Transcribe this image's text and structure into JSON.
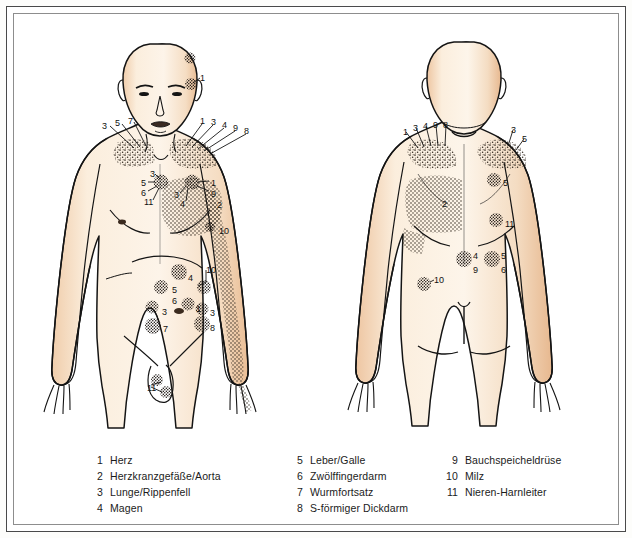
{
  "plate": {
    "title": "Head-Zonen / Referred pain zones chart",
    "views": [
      {
        "name": "front",
        "label": "front view"
      },
      {
        "name": "back",
        "label": "back view"
      }
    ]
  },
  "colors": {
    "skin_light": "#fbeedd",
    "skin_mid": "#f3d9bd",
    "skin_shadow": "#e6b48c",
    "ink": "#1b1b1b",
    "stipple": "#2a2118",
    "page": "#ffffff",
    "frame_outer": "#4a4a4a",
    "frame_inner": "#8d8d8d"
  },
  "legend": {
    "columns": [
      {
        "name": "legend-column-1",
        "entries": [
          {
            "num": "1",
            "text": "Herz"
          },
          {
            "num": "2",
            "text": "Herzkranzgefäße/Aorta"
          },
          {
            "num": "3",
            "text": "Lunge/Rippenfell"
          },
          {
            "num": "4",
            "text": "Magen"
          }
        ]
      },
      {
        "name": "legend-column-2",
        "entries": [
          {
            "num": "5",
            "text": "Leber/Galle"
          },
          {
            "num": "6",
            "text": "Zwölffingerdarm"
          },
          {
            "num": "7",
            "text": "Wurmfortsatz"
          },
          {
            "num": "8",
            "text": "S-förmiger Dickdarm"
          }
        ]
      },
      {
        "name": "legend-column-3",
        "entries": [
          {
            "num": "9",
            "text": "Bauchspeicheldrüse"
          },
          {
            "num": "10",
            "text": "Milz"
          },
          {
            "num": "11",
            "text": "Nieren-Harnleiter"
          }
        ]
      }
    ]
  },
  "front_labels": [
    {
      "id": "front-head-1",
      "num": "1",
      "x": 186,
      "y": 60
    },
    {
      "id": "front-lshoulder-3",
      "num": "3",
      "x": 88,
      "y": 108
    },
    {
      "id": "front-lshoulder-5",
      "num": "5",
      "x": 101,
      "y": 105
    },
    {
      "id": "front-lshoulder-7",
      "num": "7",
      "x": 114,
      "y": 103
    },
    {
      "id": "front-rshoulder-1",
      "num": "1",
      "x": 186,
      "y": 103
    },
    {
      "id": "front-rshoulder-3",
      "num": "3",
      "x": 197,
      "y": 104
    },
    {
      "id": "front-rshoulder-4",
      "num": "4",
      "x": 208,
      "y": 107
    },
    {
      "id": "front-rshoulder-9",
      "num": "9",
      "x": 219,
      "y": 110
    },
    {
      "id": "front-rshoulder-8",
      "num": "8",
      "x": 230,
      "y": 113
    },
    {
      "id": "front-lclav-3",
      "num": "3",
      "x": 136,
      "y": 156
    },
    {
      "id": "front-lclav-5",
      "num": "5",
      "x": 127,
      "y": 165
    },
    {
      "id": "front-lclav-6",
      "num": "6",
      "x": 127,
      "y": 175
    },
    {
      "id": "front-lclav-11",
      "num": "11",
      "x": 130,
      "y": 184
    },
    {
      "id": "front-rclav-1",
      "num": "1",
      "x": 197,
      "y": 165
    },
    {
      "id": "front-rclav-9",
      "num": "9",
      "x": 197,
      "y": 176
    },
    {
      "id": "front-mid-3",
      "num": "3",
      "x": 160,
      "y": 177
    },
    {
      "id": "front-mid-4",
      "num": "4",
      "x": 166,
      "y": 186
    },
    {
      "id": "front-chest-2",
      "num": "2",
      "x": 203,
      "y": 187
    },
    {
      "id": "front-chest-10",
      "num": "10",
      "x": 205,
      "y": 213
    },
    {
      "id": "front-abd-4",
      "num": "4",
      "x": 174,
      "y": 260
    },
    {
      "id": "front-abd-5",
      "num": "5",
      "x": 158,
      "y": 272
    },
    {
      "id": "front-abd-6",
      "num": "6",
      "x": 158,
      "y": 283
    },
    {
      "id": "front-abd-10",
      "num": "10",
      "x": 192,
      "y": 252
    },
    {
      "id": "front-abd-l3",
      "num": "3",
      "x": 148,
      "y": 294
    },
    {
      "id": "front-abd-1",
      "num": "1",
      "x": 182,
      "y": 291
    },
    {
      "id": "front-abd-r3",
      "num": "3",
      "x": 196,
      "y": 295
    },
    {
      "id": "front-abd-7",
      "num": "7",
      "x": 149,
      "y": 311
    },
    {
      "id": "front-abd-8",
      "num": "8",
      "x": 196,
      "y": 310
    },
    {
      "id": "front-groin-11",
      "num": "11",
      "x": 133,
      "y": 370
    }
  ],
  "back_labels": [
    {
      "id": "back-lshoulder-1",
      "num": "1",
      "x": 389,
      "y": 114
    },
    {
      "id": "back-lshoulder-3",
      "num": "3",
      "x": 399,
      "y": 110
    },
    {
      "id": "back-lshoulder-4",
      "num": "4",
      "x": 409,
      "y": 108
    },
    {
      "id": "back-lshoulder-9",
      "num": "9",
      "x": 419,
      "y": 107
    },
    {
      "id": "back-lshoulder-8",
      "num": "8",
      "x": 429,
      "y": 107
    },
    {
      "id": "back-rshoulder-3",
      "num": "3",
      "x": 497,
      "y": 112
    },
    {
      "id": "back-rshoulder-5",
      "num": "5",
      "x": 508,
      "y": 121
    },
    {
      "id": "back-chest-2",
      "num": "2",
      "x": 428,
      "y": 186
    },
    {
      "id": "back-chest-5",
      "num": "5",
      "x": 489,
      "y": 165
    },
    {
      "id": "back-chest-11",
      "num": "11",
      "x": 491,
      "y": 206
    },
    {
      "id": "back-abd-4",
      "num": "4",
      "x": 459,
      "y": 238
    },
    {
      "id": "back-abd-9",
      "num": "9",
      "x": 459,
      "y": 252
    },
    {
      "id": "back-abd-5",
      "num": "5",
      "x": 487,
      "y": 238
    },
    {
      "id": "back-abd-6",
      "num": "6",
      "x": 487,
      "y": 252
    },
    {
      "id": "back-side-10",
      "num": "10",
      "x": 420,
      "y": 262
    }
  ]
}
